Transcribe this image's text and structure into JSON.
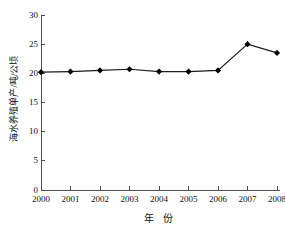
{
  "chart_data": {
    "type": "line",
    "title": "",
    "subtitle": "",
    "xlabel": "年  份",
    "ylabel": "海水养殖单产/吨/公顷",
    "categories": [
      "2000",
      "2001",
      "2002",
      "2003",
      "2004",
      "2005",
      "2006",
      "2007",
      "2008"
    ],
    "x": [
      2000,
      2001,
      2002,
      2003,
      2004,
      2005,
      2006,
      2007,
      2008
    ],
    "values": [
      20.2,
      20.3,
      20.5,
      20.7,
      20.3,
      20.3,
      20.5,
      25.0,
      23.5
    ],
    "series": [
      {
        "name": "海水养殖单产",
        "values": [
          20.2,
          20.3,
          20.5,
          20.7,
          20.3,
          20.3,
          20.5,
          25.0,
          23.5
        ]
      }
    ],
    "ylim": [
      0,
      30
    ],
    "xlim": [
      2000,
      2008
    ],
    "yticks": [
      0,
      5,
      10,
      15,
      20,
      25,
      30
    ],
    "ytick_labels": [
      "0",
      "5",
      "10",
      "15",
      "20",
      "25",
      "30"
    ],
    "xticks": [
      2000,
      2001,
      2002,
      2003,
      2004,
      2005,
      2006,
      2007,
      2008
    ],
    "xtick_labels": [
      "2000",
      "2001",
      "2002",
      "2003",
      "2004",
      "2005",
      "2006",
      "2007",
      "2008"
    ],
    "grid": false,
    "legend": false,
    "legend_position": "none",
    "marker": "diamond",
    "line_color": "#1a1a1a",
    "marker_color": "#000000",
    "axis_color": "#4d4d4d",
    "background_color": "#ffffff"
  },
  "axes": {
    "y_title": "海水养殖单产/吨/公顷",
    "x_title": "年  份"
  }
}
